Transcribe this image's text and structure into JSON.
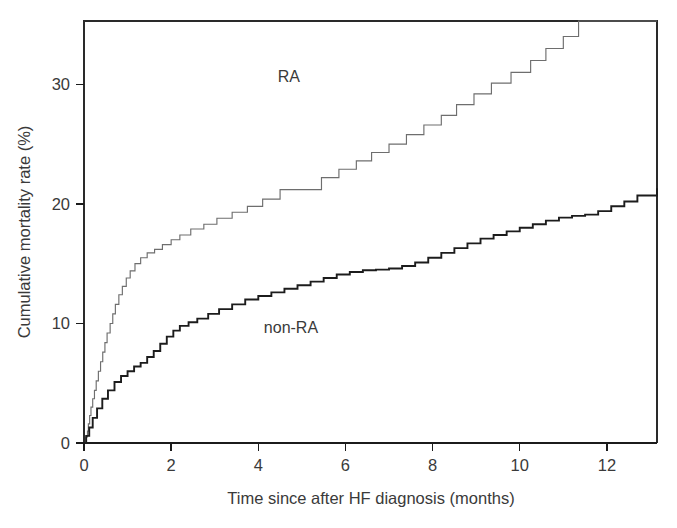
{
  "chart_data": {
    "type": "line",
    "subtype": "kaplan-meier-cumulative-incidence",
    "title": "",
    "xlabel": "Time since after HF diagnosis (months)",
    "ylabel": "Cumulative mortality rate (%)",
    "xlim": [
      0,
      13.15
    ],
    "ylim": [
      0,
      35.3
    ],
    "xticks": [
      0,
      2,
      4,
      6,
      8,
      10,
      12
    ],
    "xtick_labels": [
      "0",
      "2",
      "4",
      "6",
      "8",
      "10",
      "12"
    ],
    "yticks": [
      0,
      10,
      20,
      30
    ],
    "ytick_labels": [
      "0",
      "10",
      "20",
      "30"
    ],
    "grid": false,
    "legend_position": "inline-annotations",
    "annotations": [
      {
        "text": "RA",
        "x": 4.7,
        "y": 30.2
      },
      {
        "text": "non-RA",
        "x": 4.75,
        "y": 9.2
      }
    ],
    "colors": {
      "ra": "#6e6e6e",
      "non_ra": "#1c1c1c",
      "axis": "#1b1b1b",
      "text": "#3a3a3a",
      "background": "#ffffff"
    },
    "series": [
      {
        "name": "RA",
        "color": "#6e6e6e",
        "line_width": 1.15,
        "step": "post",
        "final_value": 35.3,
        "x": [
          0,
          0.04,
          0.08,
          0.1,
          0.13,
          0.16,
          0.2,
          0.24,
          0.28,
          0.33,
          0.38,
          0.43,
          0.48,
          0.53,
          0.6,
          0.66,
          0.72,
          0.8,
          0.88,
          0.97,
          1.06,
          1.17,
          1.3,
          1.45,
          1.62,
          1.8,
          2.0,
          2.2,
          2.45,
          2.75,
          3.05,
          3.4,
          3.75,
          4.1,
          4.5,
          5.0,
          5.45,
          5.85,
          6.25,
          6.6,
          7.0,
          7.4,
          7.8,
          8.2,
          8.55,
          8.95,
          9.35,
          9.8,
          10.25,
          10.6,
          11.0,
          11.35,
          13.15
        ],
        "y": [
          0,
          0.5,
          1.0,
          1.6,
          2.3,
          3.0,
          3.7,
          4.4,
          5.2,
          6.0,
          6.8,
          7.6,
          8.4,
          9.2,
          10.0,
          10.8,
          11.6,
          12.4,
          13.1,
          13.8,
          14.4,
          15.0,
          15.5,
          15.9,
          16.2,
          16.6,
          17.0,
          17.4,
          17.9,
          18.3,
          18.8,
          19.3,
          19.8,
          20.4,
          21.2,
          21.2,
          22.2,
          22.9,
          23.6,
          24.3,
          25.0,
          25.8,
          26.6,
          27.4,
          28.3,
          29.2,
          30.1,
          31.0,
          32.0,
          33.0,
          34.0,
          35.3,
          35.3
        ]
      },
      {
        "name": "non-RA",
        "color": "#1c1c1c",
        "line_width": 1.9,
        "step": "post",
        "final_value": 21.3,
        "x": [
          0,
          0.05,
          0.12,
          0.2,
          0.3,
          0.42,
          0.55,
          0.7,
          0.85,
          1.0,
          1.15,
          1.3,
          1.45,
          1.6,
          1.75,
          1.9,
          2.05,
          2.2,
          2.4,
          2.6,
          2.85,
          3.1,
          3.4,
          3.7,
          4.0,
          4.3,
          4.6,
          4.9,
          5.2,
          5.5,
          5.8,
          6.1,
          6.4,
          6.7,
          7.0,
          7.3,
          7.6,
          7.9,
          8.2,
          8.5,
          8.8,
          9.1,
          9.4,
          9.7,
          10.0,
          10.3,
          10.6,
          10.9,
          11.2,
          11.5,
          11.8,
          12.1,
          12.4,
          12.7,
          13.15
        ],
        "y": [
          0,
          0.6,
          1.3,
          2.1,
          2.9,
          3.7,
          4.4,
          5.1,
          5.6,
          6.0,
          6.4,
          6.7,
          7.2,
          7.7,
          8.3,
          8.9,
          9.4,
          9.8,
          10.1,
          10.4,
          10.8,
          11.2,
          11.6,
          12.0,
          12.3,
          12.6,
          12.9,
          13.2,
          13.5,
          13.8,
          14.1,
          14.3,
          14.45,
          14.5,
          14.6,
          14.8,
          15.1,
          15.5,
          15.9,
          16.3,
          16.7,
          17.1,
          17.4,
          17.7,
          18.0,
          18.3,
          18.6,
          18.85,
          19.0,
          19.1,
          19.4,
          19.8,
          20.2,
          20.7,
          21.3
        ]
      }
    ]
  },
  "plot": {
    "ra_label": "RA",
    "non_ra_label": "non-RA",
    "x_axis_title": "Time since after HF diagnosis (months)",
    "y_axis_title": "Cumulative mortality rate (%)"
  }
}
